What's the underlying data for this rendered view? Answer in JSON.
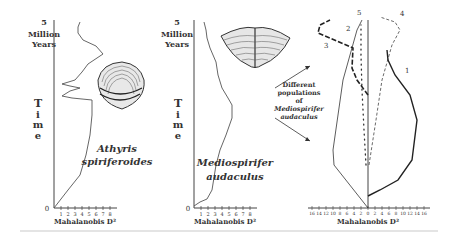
{
  "figure": {
    "panels": [
      {
        "id": "athyris",
        "y_top_label": [
          "5",
          "Million",
          "Years"
        ],
        "y_axis_title": [
          "T",
          "i",
          "m",
          "e"
        ],
        "y_zero_label": "0",
        "x_ticks": [
          "1",
          "2",
          "3",
          "4",
          "5",
          "6",
          "7",
          "8"
        ],
        "x_label": "Mahalanobis D²",
        "species_name": [
          "Athyris",
          "spiriferoides"
        ]
      },
      {
        "id": "mediospirifer",
        "y_top_label": [
          "5",
          "Million",
          "Years"
        ],
        "y_axis_title": [
          "T",
          "i",
          "m",
          "e"
        ],
        "y_zero_label": "0",
        "x_ticks": [
          "1",
          "2",
          "3",
          "4",
          "5",
          "6",
          "7",
          "8"
        ],
        "x_label": "Mahalanobis D²",
        "species_name": [
          "Mediospirifer",
          "audaculus"
        ]
      },
      {
        "id": "populations",
        "x_ticks_left": [
          "16",
          "14",
          "12",
          "10",
          "8",
          "6",
          "4",
          "2"
        ],
        "x_tick_zero": "0",
        "x_ticks_right": [
          "2",
          "4",
          "6",
          "8",
          "10",
          "12",
          "14",
          "16"
        ],
        "x_label": "Mahalanobis D²",
        "line_labels": [
          "1",
          "2",
          "3",
          "4",
          "5"
        ]
      }
    ],
    "annotation": [
      "Different",
      "populations",
      "of",
      "Mediospirifer",
      "audaculus"
    ]
  }
}
